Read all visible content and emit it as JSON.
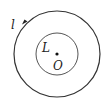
{
  "diagram": {
    "outer_circle": {
      "label": "l",
      "cx": 57,
      "cy": 54,
      "r": 43,
      "direction": "counter-clockwise"
    },
    "inner_circle": {
      "label": "L",
      "cx": 57,
      "cy": 54,
      "r": 21
    },
    "center_point": {
      "label": "O",
      "cx": 57,
      "cy": 54
    },
    "colors": {
      "stroke": "#333333",
      "background": "#ffffff"
    }
  }
}
